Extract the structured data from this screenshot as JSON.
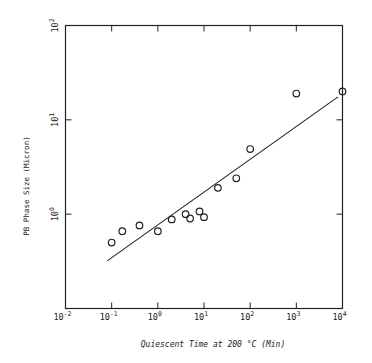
{
  "chart_data": {
    "type": "scatter",
    "title": "",
    "xlabel": "Quiescent Time at 200 °C (Min)",
    "ylabel": "PB Phase Size (Micron)",
    "xscale": "log",
    "yscale": "log",
    "xlim": [
      0.01,
      10000
    ],
    "ylim": [
      0.1,
      100
    ],
    "grid": false,
    "legend": null,
    "x_ticks": [
      {
        "base": "10",
        "exp": "-2",
        "value": 0.01
      },
      {
        "base": "10",
        "exp": "-1",
        "value": 0.1
      },
      {
        "base": "10",
        "exp": "0",
        "value": 1
      },
      {
        "base": "10",
        "exp": "1",
        "value": 10
      },
      {
        "base": "10",
        "exp": "2",
        "value": 100
      },
      {
        "base": "10",
        "exp": "3",
        "value": 1000
      },
      {
        "base": "10",
        "exp": "4",
        "value": 10000
      }
    ],
    "y_ticks": [
      {
        "base": "10",
        "exp": "0",
        "value": 1
      },
      {
        "base": "10",
        "exp": "1",
        "value": 10
      },
      {
        "base": "10",
        "exp": "2",
        "value": 100
      }
    ],
    "series": [
      {
        "name": "Measured",
        "marker": "open-circle",
        "points": [
          {
            "x": 0.1,
            "y": 0.5
          },
          {
            "x": 0.17,
            "y": 0.66
          },
          {
            "x": 0.4,
            "y": 0.76
          },
          {
            "x": 1,
            "y": 0.66
          },
          {
            "x": 2,
            "y": 0.88
          },
          {
            "x": 4,
            "y": 1.0
          },
          {
            "x": 5,
            "y": 0.9
          },
          {
            "x": 8,
            "y": 1.07
          },
          {
            "x": 10,
            "y": 0.93
          },
          {
            "x": 20,
            "y": 1.9
          },
          {
            "x": 50,
            "y": 2.4
          },
          {
            "x": 100,
            "y": 4.9
          },
          {
            "x": 1000,
            "y": 19
          },
          {
            "x": 10000,
            "y": 20
          }
        ]
      },
      {
        "name": "Fit",
        "type": "line",
        "points": [
          {
            "x": 0.08,
            "y": 0.32
          },
          {
            "x": 8000,
            "y": 17.5
          }
        ]
      }
    ]
  },
  "colors": {
    "ink": "#222222",
    "background": "#ffffff"
  }
}
